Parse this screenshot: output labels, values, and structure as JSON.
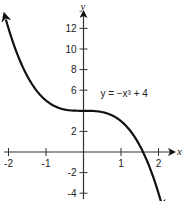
{
  "chart_data": {
    "type": "line",
    "title": "",
    "function": "y = -x^3 + 4",
    "annotation": {
      "text": "y = −x³ + 4",
      "x": 0.45,
      "y": 5.3
    },
    "xlabel": "x",
    "ylabel": "y",
    "xlim": [
      -2.2,
      2.35
    ],
    "ylim": [
      -4.8,
      13.7
    ],
    "x_ticks": [
      -2,
      -1,
      1,
      2
    ],
    "x_tick_labels": [
      "-2",
      "-1",
      "1",
      "2"
    ],
    "y_ticks": [
      -4,
      -2,
      2,
      4,
      6,
      8,
      10,
      12
    ],
    "y_tick_labels": [
      "-4",
      "-2",
      "2",
      "",
      "6",
      "8",
      "10",
      "12"
    ],
    "grid": false,
    "legend": null,
    "series": [
      {
        "name": "y = -x^3 + 4",
        "x": [
          -2.07,
          -2,
          -1.5,
          -1,
          -0.5,
          0,
          0.5,
          1,
          1.5,
          1.587,
          2,
          2.07
        ],
        "y": [
          12.87,
          12,
          7.375,
          5,
          4.125,
          4,
          3.875,
          3,
          0.625,
          0,
          -4,
          -4.87
        ]
      }
    ],
    "arrows": {
      "curve_left_end": true,
      "curve_right_end": true,
      "x_axis": true,
      "y_axis": true
    },
    "colors": {
      "curve": "#111111",
      "axis": "#333333",
      "text": "#222222"
    }
  }
}
